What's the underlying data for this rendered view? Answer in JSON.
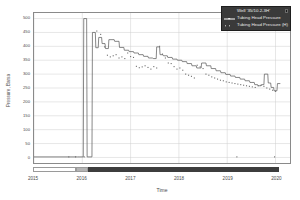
{
  "chart_data": {
    "type": "line",
    "title": "",
    "xlabel": "Time",
    "ylabel": "Pressure, Barsa",
    "xlim": [
      2015.0,
      2020.3
    ],
    "ylim": [
      -20,
      520
    ],
    "grid": true,
    "legend_position": "top-right",
    "xticks": [
      {
        "value": 2015,
        "label": "2015"
      },
      {
        "value": 2016,
        "label": "2016"
      },
      {
        "value": 2017,
        "label": "2017"
      },
      {
        "value": 2018,
        "label": "2018"
      },
      {
        "value": 2019,
        "label": "2019"
      },
      {
        "value": 2020,
        "label": "2020"
      }
    ],
    "yticks": [
      {
        "value": 0,
        "label": "0"
      },
      {
        "value": 50,
        "label": "50"
      },
      {
        "value": 100,
        "label": "100"
      },
      {
        "value": 150,
        "label": "150"
      },
      {
        "value": 200,
        "label": "200"
      },
      {
        "value": 250,
        "label": "250"
      },
      {
        "value": 300,
        "label": "300"
      },
      {
        "value": 350,
        "label": "350"
      },
      {
        "value": 400,
        "label": "400"
      },
      {
        "value": 450,
        "label": "450"
      },
      {
        "value": 500,
        "label": "500"
      }
    ],
    "series": [
      {
        "name": "Tubing Head Pressure",
        "style": "step-line",
        "color": "#555555",
        "points": [
          [
            2015.0,
            2
          ],
          [
            2015.9,
            2
          ],
          [
            2015.95,
            2
          ],
          [
            2016.02,
            2
          ],
          [
            2016.03,
            500
          ],
          [
            2016.09,
            500
          ],
          [
            2016.1,
            2
          ],
          [
            2016.2,
            2
          ],
          [
            2016.21,
            450
          ],
          [
            2016.27,
            450
          ],
          [
            2016.28,
            395
          ],
          [
            2016.33,
            395
          ],
          [
            2016.34,
            432
          ],
          [
            2016.4,
            432
          ],
          [
            2016.41,
            410
          ],
          [
            2016.47,
            410
          ],
          [
            2016.48,
            392
          ],
          [
            2016.54,
            392
          ],
          [
            2016.55,
            424
          ],
          [
            2016.66,
            424
          ],
          [
            2016.67,
            418
          ],
          [
            2016.76,
            418
          ],
          [
            2016.77,
            396
          ],
          [
            2016.86,
            396
          ],
          [
            2016.87,
            386
          ],
          [
            2016.96,
            386
          ],
          [
            2016.97,
            381
          ],
          [
            2017.06,
            381
          ],
          [
            2017.07,
            376
          ],
          [
            2017.16,
            376
          ],
          [
            2017.17,
            370
          ],
          [
            2017.26,
            370
          ],
          [
            2017.27,
            364
          ],
          [
            2017.36,
            364
          ],
          [
            2017.37,
            358
          ],
          [
            2017.46,
            358
          ],
          [
            2017.47,
            356
          ],
          [
            2017.53,
            356
          ],
          [
            2017.54,
            398
          ],
          [
            2017.6,
            398
          ],
          [
            2017.61,
            370
          ],
          [
            2017.67,
            370
          ],
          [
            2017.68,
            366
          ],
          [
            2017.76,
            366
          ],
          [
            2017.77,
            360
          ],
          [
            2017.86,
            360
          ],
          [
            2017.87,
            354
          ],
          [
            2017.96,
            354
          ],
          [
            2017.97,
            350
          ],
          [
            2018.06,
            350
          ],
          [
            2018.07,
            345
          ],
          [
            2018.16,
            345
          ],
          [
            2018.17,
            338
          ],
          [
            2018.26,
            338
          ],
          [
            2018.27,
            330
          ],
          [
            2018.36,
            330
          ],
          [
            2018.37,
            322
          ],
          [
            2018.46,
            322
          ],
          [
            2018.47,
            340
          ],
          [
            2018.56,
            340
          ],
          [
            2018.57,
            330
          ],
          [
            2018.66,
            330
          ],
          [
            2018.67,
            320
          ],
          [
            2018.76,
            320
          ],
          [
            2018.77,
            312
          ],
          [
            2018.86,
            312
          ],
          [
            2018.87,
            305
          ],
          [
            2018.96,
            305
          ],
          [
            2018.97,
            299
          ],
          [
            2019.06,
            299
          ],
          [
            2019.07,
            293
          ],
          [
            2019.16,
            293
          ],
          [
            2019.17,
            288
          ],
          [
            2019.26,
            288
          ],
          [
            2019.27,
            282
          ],
          [
            2019.36,
            282
          ],
          [
            2019.37,
            276
          ],
          [
            2019.46,
            276
          ],
          [
            2019.47,
            270
          ],
          [
            2019.56,
            270
          ],
          [
            2019.57,
            262
          ],
          [
            2019.63,
            262
          ],
          [
            2019.64,
            258
          ],
          [
            2019.7,
            258
          ],
          [
            2019.71,
            262
          ],
          [
            2019.76,
            262
          ],
          [
            2019.77,
            300
          ],
          [
            2019.84,
            300
          ],
          [
            2019.85,
            268
          ],
          [
            2019.9,
            268
          ],
          [
            2019.91,
            252
          ],
          [
            2019.96,
            252
          ],
          [
            2019.97,
            240
          ],
          [
            2020.03,
            240
          ],
          [
            2020.04,
            266
          ],
          [
            2020.1,
            266
          ]
        ]
      },
      {
        "name": "Tubing Head Pressure (H)",
        "style": "scatter",
        "color": "#6a6a6a",
        "points": [
          [
            2016.3,
            455
          ],
          [
            2016.38,
            443
          ],
          [
            2016.46,
            398
          ],
          [
            2016.52,
            368
          ],
          [
            2016.58,
            362
          ],
          [
            2016.64,
            366
          ],
          [
            2016.7,
            370
          ],
          [
            2016.76,
            358
          ],
          [
            2016.82,
            362
          ],
          [
            2016.88,
            356
          ],
          [
            2016.94,
            376
          ],
          [
            2017.0,
            363
          ],
          [
            2017.06,
            360
          ],
          [
            2017.12,
            328
          ],
          [
            2017.18,
            323
          ],
          [
            2017.24,
            326
          ],
          [
            2017.3,
            330
          ],
          [
            2017.36,
            324
          ],
          [
            2017.42,
            318
          ],
          [
            2017.48,
            327
          ],
          [
            2017.54,
            322
          ],
          [
            2017.6,
            400
          ],
          [
            2017.66,
            372
          ],
          [
            2017.72,
            358
          ],
          [
            2017.78,
            340
          ],
          [
            2017.84,
            338
          ],
          [
            2017.9,
            327
          ],
          [
            2017.96,
            318
          ],
          [
            2018.02,
            322
          ],
          [
            2018.08,
            314
          ],
          [
            2018.14,
            300
          ],
          [
            2018.2,
            296
          ],
          [
            2018.26,
            292
          ],
          [
            2018.32,
            286
          ],
          [
            2018.38,
            332
          ],
          [
            2018.44,
            326
          ],
          [
            2018.5,
            320
          ],
          [
            2018.56,
            300
          ],
          [
            2018.62,
            296
          ],
          [
            2018.68,
            290
          ],
          [
            2018.74,
            286
          ],
          [
            2018.8,
            282
          ],
          [
            2018.86,
            278
          ],
          [
            2018.92,
            276
          ],
          [
            2018.98,
            272
          ],
          [
            2019.04,
            270
          ],
          [
            2019.1,
            268
          ],
          [
            2019.16,
            266
          ],
          [
            2019.22,
            264
          ],
          [
            2019.28,
            262
          ],
          [
            2019.34,
            260
          ],
          [
            2019.4,
            258
          ],
          [
            2019.46,
            256
          ],
          [
            2019.52,
            254
          ],
          [
            2019.58,
            252
          ],
          [
            2019.64,
            258
          ],
          [
            2019.7,
            260
          ],
          [
            2019.76,
            256
          ],
          [
            2019.82,
            250
          ],
          [
            2019.88,
            246
          ],
          [
            2019.94,
            242
          ],
          [
            2020.0,
            238
          ],
          [
            2015.72,
            2
          ],
          [
            2015.86,
            2
          ],
          [
            2016.04,
            2
          ],
          [
            2019.2,
            2
          ],
          [
            2019.98,
            2
          ]
        ]
      }
    ]
  },
  "legend": {
    "title": "Well '35/10.2-3H'",
    "entries": [
      {
        "label": "Tubing Head Pressure",
        "marker": "line"
      },
      {
        "label": "Tubing Head Pressure (H)",
        "marker": "dots"
      }
    ],
    "close_icon": "close-icon"
  },
  "status_bar": {
    "segments": [
      {
        "from": 2015.0,
        "to": 2015.88,
        "color": "#ffffff",
        "border": "#9a9a9a"
      },
      {
        "from": 2015.88,
        "to": 2016.12,
        "color": "#b4b4b4",
        "border": "#9a9a9a"
      },
      {
        "from": 2016.12,
        "to": 2020.05,
        "color": "#3d3d3d",
        "border": "#3d3d3d"
      }
    ]
  },
  "colors": {
    "frame": "#8a8a8a",
    "grid": "#cfcfcf",
    "line": "#555555",
    "scatter": "#6a6a6a",
    "legend_bg": "#3a3a3a",
    "legend_text": "#e8e8e8",
    "background": "#ffffff"
  }
}
